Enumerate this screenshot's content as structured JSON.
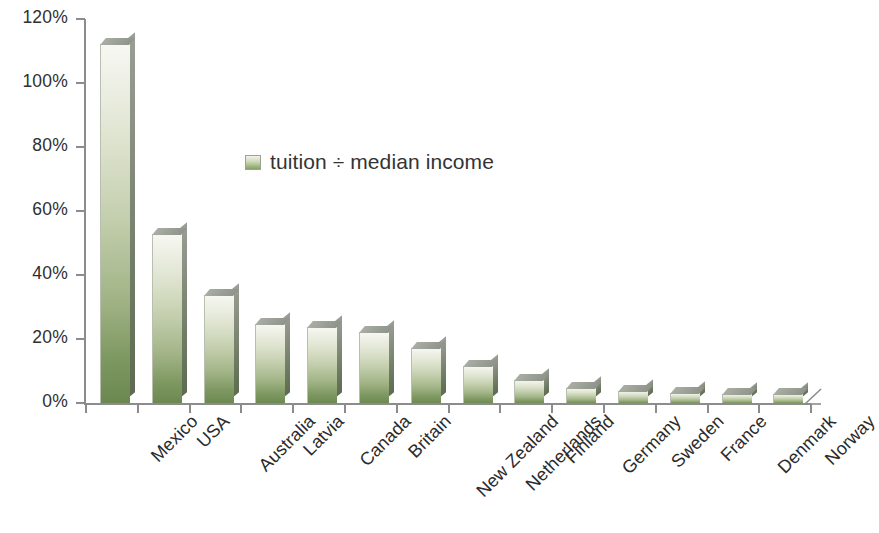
{
  "chart_data": {
    "type": "bar",
    "title": "",
    "subtitle": "",
    "xlabel": "",
    "ylabel": "",
    "legend": [
      "tuition ÷ median income"
    ],
    "legend_position": "inside-top-center",
    "grid": false,
    "ylim": [
      0,
      120
    ],
    "ytick_labels": [
      "120%",
      "100%",
      "80%",
      "60%",
      "40%",
      "20%",
      "0%"
    ],
    "ytick_values": [
      120,
      100,
      80,
      60,
      40,
      20,
      0
    ],
    "value_unit": "percent",
    "categories": [
      "Mexico",
      "USA",
      "Australia",
      "Latvia",
      "Canada",
      "Britain",
      "New Zealand",
      "Netherlands",
      "Finland",
      "Germany",
      "Sweden",
      "France",
      "Denmark",
      "Norway"
    ],
    "series": [
      {
        "name": "tuition ÷ median income",
        "color": "#8aa564",
        "values": [
          112.5,
          53,
          34,
          25,
          24,
          22.5,
          17.5,
          12,
          7.5,
          5,
          4,
          3.5,
          3,
          3
        ]
      }
    ]
  },
  "legend": {
    "swatch_name": "legend-color-swatch",
    "label": "tuition ÷ median income"
  },
  "colors": {
    "bar_top": "#f7f8f3",
    "bar_bottom": "#6b8750",
    "bar_side": "#6e7a63",
    "axis": "#8c8c8c",
    "text": "#2b2b2b",
    "background": "#ffffff"
  }
}
